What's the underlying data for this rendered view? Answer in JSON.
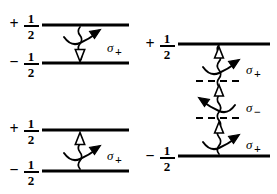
{
  "figure": {
    "background_color": "#ffffff",
    "ink_color": "#000000",
    "width": 277,
    "height": 194,
    "panels": [
      {
        "id": "top-left",
        "levels": [
          {
            "sign": "+",
            "numerator": "1",
            "denominator": "2",
            "style": "solid"
          },
          {
            "sign": "−",
            "numerator": "1",
            "denominator": "2",
            "style": "solid"
          }
        ],
        "transitions": [
          {
            "label_base": "σ",
            "label_sub": "+",
            "direction": "downward",
            "arrowhead": "hollow",
            "curve_direction": "up-right"
          }
        ]
      },
      {
        "id": "bottom-left",
        "levels": [
          {
            "sign": "+",
            "numerator": "1",
            "denominator": "2",
            "style": "solid"
          },
          {
            "sign": "−",
            "numerator": "1",
            "denominator": "2",
            "style": "solid"
          }
        ],
        "transitions": [
          {
            "label_base": "σ",
            "label_sub": "+",
            "direction": "upward",
            "arrowhead": "hollow",
            "curve_direction": "up-right"
          }
        ]
      },
      {
        "id": "right",
        "levels": [
          {
            "sign": "+",
            "numerator": "1",
            "denominator": "2",
            "style": "solid"
          },
          {
            "sign": "",
            "numerator": "",
            "denominator": "",
            "style": "dashed"
          },
          {
            "sign": "",
            "numerator": "",
            "denominator": "",
            "style": "dashed"
          },
          {
            "sign": "−",
            "numerator": "1",
            "denominator": "2",
            "style": "solid"
          }
        ],
        "transitions": [
          {
            "label_base": "σ",
            "label_sub": "+",
            "direction": "upward",
            "arrowhead": "hollow",
            "curve_direction": "up-right"
          },
          {
            "label_base": "σ",
            "label_sub": "−",
            "direction": "upward",
            "arrowhead": "hollow",
            "curve_direction": "up-left"
          },
          {
            "label_base": "σ",
            "label_sub": "+",
            "direction": "upward",
            "arrowhead": "hollow",
            "curve_direction": "up-right"
          }
        ]
      }
    ]
  }
}
